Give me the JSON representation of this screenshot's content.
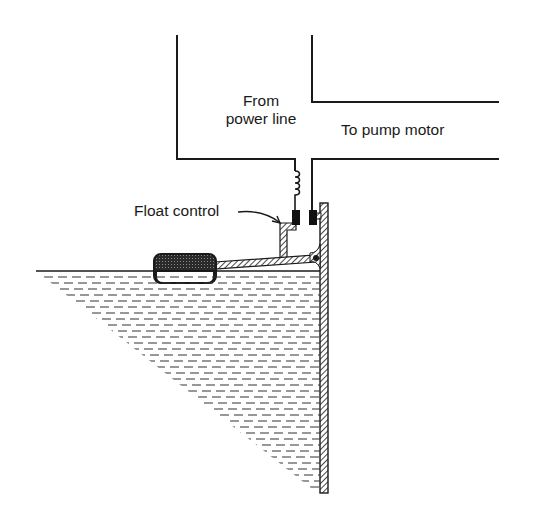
{
  "diagram": {
    "labels": {
      "from_power_line_1": "From",
      "from_power_line_2": "power line",
      "to_pump_motor": "To pump motor",
      "float_control": "Float control"
    },
    "components": [
      "power-line-conductor",
      "pump-motor-conductor",
      "coil-spring",
      "contacts",
      "float-control-arm",
      "float",
      "tank-wall",
      "water"
    ],
    "colors": {
      "ink": "#1a1a1a",
      "background": "#ffffff"
    }
  }
}
